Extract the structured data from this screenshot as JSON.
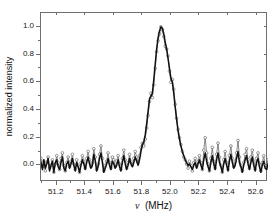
{
  "chart_data": {
    "type": "line",
    "title": "",
    "subtitle": "",
    "xlabel": "ν  (MHz)",
    "xlabel_symbol": "ν",
    "xlabel_units": "(MHz)",
    "ylabel": "normalized intensity",
    "xlim": [
      51.09,
      52.68
    ],
    "ylim": [
      -0.12,
      1.1
    ],
    "xticks": [
      51.2,
      51.4,
      51.6,
      51.8,
      52.0,
      52.2,
      52.4,
      52.6
    ],
    "xtick_labels": [
      "51.2",
      "51.4",
      "51.6",
      "51.8",
      "52.0",
      "52.2",
      "52.4",
      "52.6"
    ],
    "yticks": [
      0.0,
      0.2,
      0.4,
      0.6,
      0.8,
      1.0
    ],
    "ytick_labels": [
      "0.0",
      "0.2",
      "0.4",
      "0.6",
      "0.8",
      "1.0"
    ],
    "grid": false,
    "legend": "none",
    "frame": "box",
    "peak": {
      "center": 51.93,
      "amplitude": 1.0,
      "fwhm": 0.17
    },
    "annotations": [],
    "colors": {
      "fit_line": "#111111",
      "data_marker": "#555555",
      "frame": "#6f6f6f",
      "background": "#ffffff"
    },
    "series": [
      {
        "name": "measured spectrum",
        "style": "open-circles-dotted",
        "color": "#555555",
        "x": [
          51.09,
          51.1,
          51.11,
          51.12,
          51.13,
          51.14,
          51.15,
          51.16,
          51.17,
          51.18,
          51.19,
          51.2,
          51.21,
          51.22,
          51.23,
          51.24,
          51.25,
          51.26,
          51.27,
          51.28,
          51.29,
          51.3,
          51.31,
          51.32,
          51.33,
          51.34,
          51.35,
          51.36,
          51.37,
          51.38,
          51.39,
          51.4,
          51.41,
          51.42,
          51.43,
          51.44,
          51.45,
          51.46,
          51.47,
          51.48,
          51.49,
          51.5,
          51.51,
          51.52,
          51.53,
          51.54,
          51.55,
          51.56,
          51.57,
          51.58,
          51.59,
          51.6,
          51.61,
          51.62,
          51.63,
          51.64,
          51.65,
          51.66,
          51.67,
          51.68,
          51.69,
          51.7,
          51.71,
          51.72,
          51.73,
          51.74,
          51.75,
          51.76,
          51.77,
          51.78,
          51.79,
          51.8,
          51.81,
          51.82,
          51.83,
          51.84,
          51.85,
          51.86,
          51.87,
          51.88,
          51.89,
          51.9,
          51.91,
          51.92,
          51.93,
          51.94,
          51.95,
          51.96,
          51.97,
          51.98,
          51.99,
          52.0,
          52.01,
          52.02,
          52.03,
          52.04,
          52.05,
          52.06,
          52.07,
          52.08,
          52.09,
          52.1,
          52.11,
          52.12,
          52.13,
          52.14,
          52.15,
          52.16,
          52.17,
          52.18,
          52.19,
          52.2,
          52.21,
          52.22,
          52.23,
          52.24,
          52.25,
          52.26,
          52.27,
          52.28,
          52.29,
          52.3,
          52.31,
          52.32,
          52.33,
          52.34,
          52.35,
          52.36,
          52.37,
          52.38,
          52.39,
          52.4,
          52.41,
          52.42,
          52.43,
          52.44,
          52.45,
          52.46,
          52.47,
          52.48,
          52.49,
          52.5,
          52.51,
          52.52,
          52.53,
          52.54,
          52.55,
          52.56,
          52.57,
          52.58,
          52.59,
          52.6,
          52.61,
          52.62,
          52.63,
          52.64,
          52.65,
          52.66,
          52.67,
          52.68
        ],
        "y": [
          0.05,
          -0.01,
          0.03,
          -0.04,
          0.02,
          0.06,
          -0.02,
          0.0,
          0.04,
          -0.05,
          0.01,
          0.07,
          0.02,
          -0.03,
          0.05,
          0.09,
          0.0,
          -0.04,
          0.02,
          0.06,
          -0.01,
          0.03,
          0.08,
          0.01,
          -0.03,
          0.04,
          0.0,
          -0.05,
          0.02,
          0.07,
          0.03,
          -0.02,
          0.05,
          0.1,
          0.04,
          -0.01,
          0.02,
          0.12,
          0.06,
          -0.03,
          0.01,
          0.08,
          0.14,
          0.05,
          -0.04,
          0.0,
          0.03,
          0.09,
          0.02,
          -0.02,
          0.06,
          0.04,
          -0.01,
          0.03,
          0.07,
          0.01,
          -0.03,
          0.05,
          0.11,
          0.04,
          -0.02,
          0.02,
          0.08,
          0.03,
          0.0,
          0.05,
          0.1,
          0.06,
          0.02,
          0.07,
          0.13,
          0.16,
          0.14,
          0.19,
          0.27,
          0.36,
          0.46,
          0.52,
          0.49,
          0.58,
          0.7,
          0.82,
          0.9,
          0.95,
          1.0,
          0.98,
          0.93,
          0.86,
          0.84,
          0.79,
          0.68,
          0.6,
          0.62,
          0.55,
          0.44,
          0.34,
          0.26,
          0.2,
          0.15,
          0.1,
          0.06,
          0.04,
          0.01,
          -0.02,
          0.03,
          0.0,
          -0.04,
          0.02,
          0.05,
          -0.01,
          0.03,
          0.07,
          0.02,
          -0.03,
          0.11,
          0.2,
          0.09,
          0.01,
          -0.04,
          0.05,
          0.13,
          0.03,
          -0.02,
          0.08,
          0.16,
          0.06,
          0.0,
          -0.05,
          0.04,
          0.1,
          0.02,
          -0.03,
          0.07,
          0.14,
          0.05,
          -0.01,
          0.03,
          0.09,
          0.18,
          0.06,
          0.0,
          -0.04,
          0.02,
          0.08,
          0.12,
          0.04,
          -0.02,
          0.06,
          0.11,
          0.03,
          -0.03,
          0.05,
          0.09,
          0.01,
          -0.04,
          0.02,
          0.07,
          0.0,
          -0.02,
          0.04
        ]
      },
      {
        "name": "fit / reference trace",
        "style": "solid-line",
        "color": "#111111",
        "x": [
          51.09,
          51.1,
          51.11,
          51.12,
          51.13,
          51.14,
          51.15,
          51.16,
          51.17,
          51.18,
          51.19,
          51.2,
          51.21,
          51.22,
          51.23,
          51.24,
          51.25,
          51.26,
          51.27,
          51.28,
          51.29,
          51.3,
          51.31,
          51.32,
          51.33,
          51.34,
          51.35,
          51.36,
          51.37,
          51.38,
          51.39,
          51.4,
          51.41,
          51.42,
          51.43,
          51.44,
          51.45,
          51.46,
          51.47,
          51.48,
          51.49,
          51.5,
          51.51,
          51.52,
          51.53,
          51.54,
          51.55,
          51.56,
          51.57,
          51.58,
          51.59,
          51.6,
          51.61,
          51.62,
          51.63,
          51.64,
          51.65,
          51.66,
          51.67,
          51.68,
          51.69,
          51.7,
          51.71,
          51.72,
          51.73,
          51.74,
          51.75,
          51.76,
          51.77,
          51.78,
          51.79,
          51.8,
          51.81,
          51.82,
          51.83,
          51.84,
          51.85,
          51.86,
          51.87,
          51.88,
          51.89,
          51.9,
          51.91,
          51.92,
          51.93,
          51.94,
          51.95,
          51.96,
          51.97,
          51.98,
          51.99,
          52.0,
          52.01,
          52.02,
          52.03,
          52.04,
          52.05,
          52.06,
          52.07,
          52.08,
          52.09,
          52.1,
          52.11,
          52.12,
          52.13,
          52.14,
          52.15,
          52.16,
          52.17,
          52.18,
          52.19,
          52.2,
          52.21,
          52.22,
          52.23,
          52.24,
          52.25,
          52.26,
          52.27,
          52.28,
          52.29,
          52.3,
          52.31,
          52.32,
          52.33,
          52.34,
          52.35,
          52.36,
          52.37,
          52.38,
          52.39,
          52.4,
          52.41,
          52.42,
          52.43,
          52.44,
          52.45,
          52.46,
          52.47,
          52.48,
          52.49,
          52.5,
          52.51,
          52.52,
          52.53,
          52.54,
          52.55,
          52.56,
          52.57,
          52.58,
          52.59,
          52.6,
          52.61,
          52.62,
          52.63,
          52.64,
          52.65,
          52.66,
          52.67,
          52.68
        ],
        "y": [
          0.02,
          -0.03,
          0.04,
          -0.02,
          0.01,
          0.05,
          -0.04,
          0.0,
          0.03,
          -0.05,
          0.02,
          0.04,
          -0.01,
          -0.03,
          0.02,
          0.06,
          -0.02,
          -0.04,
          0.01,
          0.03,
          -0.02,
          0.01,
          0.05,
          0.0,
          -0.04,
          0.02,
          -0.01,
          -0.05,
          0.0,
          0.04,
          0.01,
          -0.03,
          0.02,
          0.06,
          0.01,
          -0.02,
          0.0,
          0.08,
          0.03,
          -0.04,
          -0.01,
          0.05,
          0.09,
          0.02,
          -0.05,
          -0.02,
          0.01,
          0.05,
          0.0,
          -0.03,
          0.03,
          0.01,
          -0.02,
          0.0,
          0.04,
          -0.01,
          -0.04,
          0.02,
          0.07,
          0.01,
          -0.03,
          0.0,
          0.05,
          0.01,
          -0.01,
          0.02,
          0.06,
          0.03,
          0.0,
          0.04,
          0.1,
          0.15,
          0.17,
          0.22,
          0.3,
          0.39,
          0.48,
          0.5,
          0.52,
          0.62,
          0.73,
          0.84,
          0.92,
          0.97,
          1.0,
          0.99,
          0.95,
          0.89,
          0.84,
          0.77,
          0.7,
          0.63,
          0.6,
          0.52,
          0.42,
          0.33,
          0.25,
          0.19,
          0.14,
          0.1,
          0.07,
          0.04,
          0.02,
          0.0,
          0.01,
          -0.01,
          -0.03,
          0.0,
          0.02,
          -0.02,
          0.01,
          0.04,
          0.0,
          -0.03,
          0.04,
          0.09,
          0.03,
          -0.01,
          -0.04,
          0.02,
          0.07,
          0.01,
          -0.03,
          0.04,
          0.09,
          0.02,
          -0.01,
          -0.05,
          0.01,
          0.05,
          0.0,
          -0.04,
          0.03,
          0.08,
          0.02,
          -0.02,
          0.0,
          0.05,
          0.1,
          0.02,
          -0.01,
          -0.05,
          0.0,
          0.04,
          0.07,
          0.01,
          -0.03,
          0.02,
          0.06,
          0.0,
          -0.04,
          0.02,
          0.05,
          -0.01,
          -0.05,
          0.0,
          0.03,
          -0.02,
          -0.03,
          0.01
        ]
      }
    ]
  }
}
